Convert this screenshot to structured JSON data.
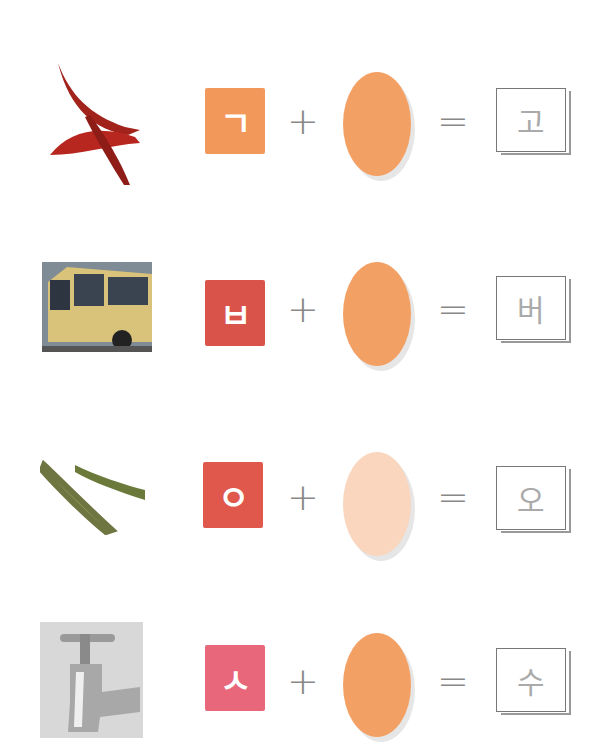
{
  "rows": [
    {
      "picture": "red-chili-peppers",
      "consonant": "ㄱ",
      "operator_plus": "+",
      "operator_equals": "=",
      "result": "고",
      "tile_color": "#f2985a",
      "oval_color": "#f3a064"
    },
    {
      "picture": "bus",
      "consonant": "ㅂ",
      "operator_plus": "+",
      "operator_equals": "=",
      "result": "버",
      "tile_color": "#d9534a",
      "oval_color": "#f3a064"
    },
    {
      "picture": "cucumbers",
      "consonant": "ㅇ",
      "operator_plus": "+",
      "operator_equals": "=",
      "result": "오",
      "tile_color": "#e0574c",
      "oval_color": "#f9d6bd"
    },
    {
      "picture": "water-faucet",
      "consonant": "ㅅ",
      "operator_plus": "+",
      "operator_equals": "=",
      "result": "수",
      "tile_color": "#e8677a",
      "oval_color": "#f3a064"
    }
  ]
}
